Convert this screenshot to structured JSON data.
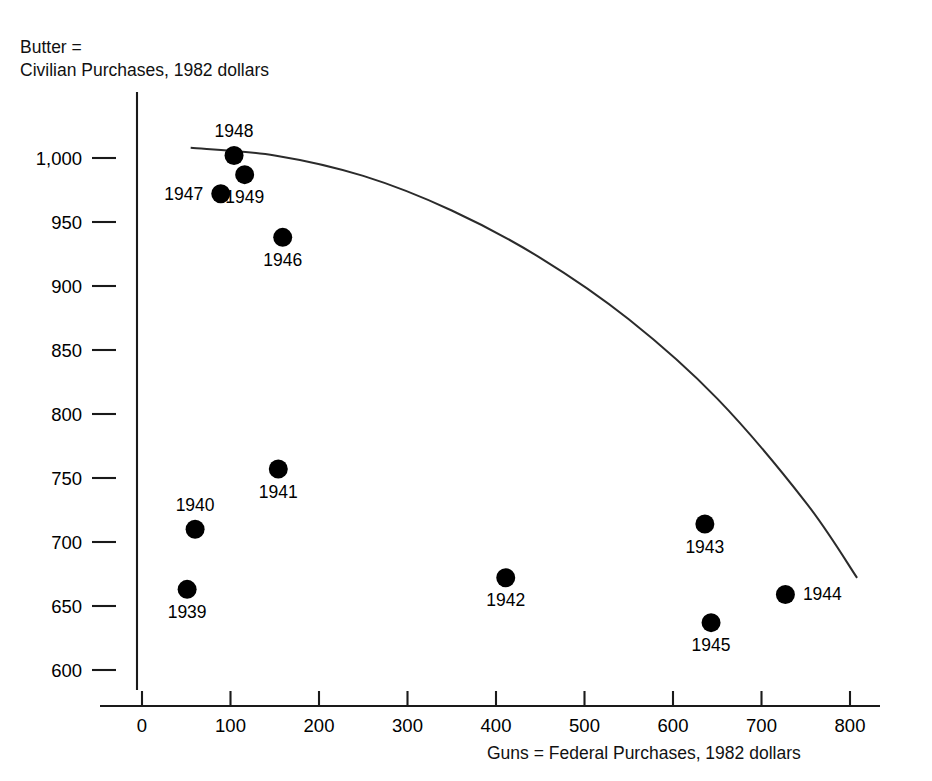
{
  "figure": {
    "y_axis_caption_line1": "Butter =",
    "y_axis_caption_line2": "Civilian Purchases, 1982 dollars",
    "x_axis_caption": "Guns = Federal Purchases, 1982 dollars"
  },
  "chart_data": {
    "type": "scatter",
    "title": "",
    "xlabel": "Guns = Federal Purchases, 1982 dollars",
    "ylabel": "Butter = Civilian Purchases, 1982 dollars",
    "xlim": [
      -40,
      870
    ],
    "ylim": [
      560,
      1030
    ],
    "xticks": [
      0,
      100,
      200,
      300,
      400,
      500,
      600,
      700,
      800
    ],
    "xtick_labels": [
      "0",
      "100",
      "200",
      "300",
      "400",
      "500",
      "600",
      "700",
      "800"
    ],
    "yticks": [
      600,
      650,
      700,
      750,
      800,
      850,
      900,
      950,
      1000
    ],
    "ytick_labels": [
      "600",
      "650",
      "700",
      "750",
      "800",
      "850",
      "900",
      "950",
      "1,000"
    ],
    "grid": false,
    "legend": false,
    "point_color": "#000000",
    "curve_color": "#2b2b2b",
    "points": [
      {
        "label": "1939",
        "x": 51,
        "y": 663,
        "label_pos": "below"
      },
      {
        "label": "1940",
        "x": 60,
        "y": 710,
        "label_pos": "above"
      },
      {
        "label": "1941",
        "x": 154,
        "y": 757,
        "label_pos": "below"
      },
      {
        "label": "1942",
        "x": 411,
        "y": 672,
        "label_pos": "below"
      },
      {
        "label": "1943",
        "x": 636,
        "y": 714,
        "label_pos": "below"
      },
      {
        "label": "1944",
        "x": 727,
        "y": 659,
        "label_pos": "right"
      },
      {
        "label": "1945",
        "x": 643,
        "y": 637,
        "label_pos": "below"
      },
      {
        "label": "1946",
        "x": 159,
        "y": 938,
        "label_pos": "below"
      },
      {
        "label": "1947",
        "x": 89,
        "y": 972,
        "label_pos": "left"
      },
      {
        "label": "1948",
        "x": 104,
        "y": 1002,
        "label_pos": "above"
      },
      {
        "label": "1949",
        "x": 116,
        "y": 987,
        "label_pos": "below"
      }
    ],
    "frontier_curve": {
      "name": "production possibilities frontier",
      "x_start": 55,
      "x_end": 808,
      "points": [
        {
          "x": 55,
          "y": 1008
        },
        {
          "x": 150,
          "y": 1002
        },
        {
          "x": 250,
          "y": 986
        },
        {
          "x": 350,
          "y": 959
        },
        {
          "x": 450,
          "y": 922
        },
        {
          "x": 550,
          "y": 874
        },
        {
          "x": 650,
          "y": 812
        },
        {
          "x": 750,
          "y": 731
        },
        {
          "x": 808,
          "y": 672
        }
      ]
    }
  }
}
